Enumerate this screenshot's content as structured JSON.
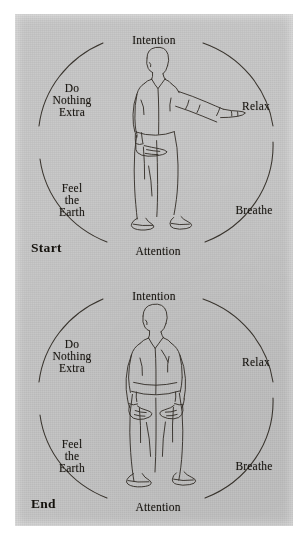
{
  "figure": {
    "type": "instructional-diagram",
    "medium": "scanned book page",
    "paper_color": "#c9c9c9",
    "ink_color": "#3a352e",
    "text_color": "#17140f",
    "panel_count": 2
  },
  "panels": [
    {
      "id": "start",
      "corner_label": "Start",
      "figure_pose": "standing man, right arm extended forward, left hand at waist",
      "ring_labels": {
        "top": "Intention",
        "right_upper": "Relax",
        "right_lower": "Breathe",
        "bottom": "Attention",
        "left_lower": "Feel\nthe\nEarth",
        "left_upper": "Do\nNothing\nExtra"
      }
    },
    {
      "id": "end",
      "corner_label": "End",
      "figure_pose": "standing man, both arms lowered, hands together in front of waist",
      "ring_labels": {
        "top": "Intention",
        "right_upper": "Relax",
        "right_lower": "Breathe",
        "bottom": "Attention",
        "left_lower": "Feel\nthe\nEarth",
        "left_upper": "Do\nNothing\nExtra"
      }
    }
  ]
}
